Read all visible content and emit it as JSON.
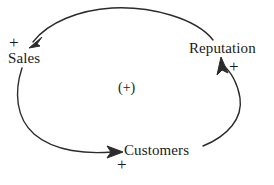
{
  "diagram": {
    "type": "causal-loop-diagram",
    "loop_polarity": "(+)",
    "loop_type": "reinforcing",
    "background_color": "#ffffff",
    "stroke_color": "#2b2b2b",
    "text_color": "#1a1a1a",
    "nodes": [
      {
        "id": "sales",
        "label": "Sales",
        "x": 36,
        "y": 58
      },
      {
        "id": "reputation",
        "label": "Reputation",
        "x": 230,
        "y": 48
      },
      {
        "id": "customers",
        "label": "Customers",
        "x": 163,
        "y": 150
      }
    ],
    "links": [
      {
        "id": "sales-to-customers",
        "from": "sales",
        "to": "customers",
        "polarity": "+",
        "polarity_label_position": "below-customers"
      },
      {
        "id": "customers-to-reputation",
        "from": "customers",
        "to": "reputation",
        "polarity": "+",
        "polarity_label_position": "right-of-reputation-arrow"
      },
      {
        "id": "reputation-to-sales",
        "from": "reputation",
        "to": "sales",
        "polarity": "+",
        "polarity_label_position": "above-sales"
      }
    ],
    "polarity_marks": [
      {
        "id": "plus-sales",
        "symbol": "+"
      },
      {
        "id": "plus-reputation",
        "symbol": "+"
      },
      {
        "id": "plus-customers",
        "symbol": "+"
      }
    ]
  }
}
